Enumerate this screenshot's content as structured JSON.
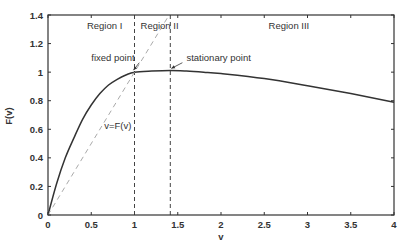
{
  "chart_data": {
    "type": "line",
    "title": "",
    "xlabel": "v",
    "ylabel": "F(v)",
    "xlim": [
      0,
      4
    ],
    "ylim": [
      0,
      1.4
    ],
    "xticks": [
      0,
      0.5,
      1,
      1.5,
      2,
      2.5,
      3,
      3.5,
      4
    ],
    "xtick_labels": [
      "0",
      "0.5",
      "1",
      "1.5",
      "2",
      "2.5",
      "3",
      "3.5",
      "4"
    ],
    "yticks": [
      0,
      0.2,
      0.4,
      0.6,
      0.8,
      1,
      1.2,
      1.4
    ],
    "ytick_labels": [
      "0",
      "0.2",
      "0.4",
      "0.6",
      "0.8",
      "1",
      "1.2",
      "1.4"
    ],
    "grid": false,
    "series": [
      {
        "name": "F(v)",
        "style": "solid",
        "x": [
          0,
          0.1,
          0.2,
          0.3,
          0.4,
          0.5,
          0.6,
          0.7,
          0.8,
          0.9,
          1.0,
          1.2,
          1.414,
          1.6,
          1.8,
          2.0,
          2.5,
          3.0,
          3.5,
          4.0
        ],
        "y": [
          0,
          0.22,
          0.4,
          0.54,
          0.67,
          0.77,
          0.85,
          0.91,
          0.95,
          0.98,
          1.0,
          1.008,
          1.012,
          1.008,
          1.0,
          0.99,
          0.955,
          0.905,
          0.85,
          0.79
        ]
      },
      {
        "name": "v=F(v)",
        "style": "dashed",
        "x": [
          0,
          1.4
        ],
        "y": [
          0,
          1.4
        ]
      }
    ],
    "vlines": [
      {
        "x": 1.0,
        "style": "dashed"
      },
      {
        "x": 1.414,
        "style": "dashed"
      }
    ],
    "annotations": [
      {
        "text": "Region I",
        "x": 0.45,
        "y": 1.3
      },
      {
        "text": "Region II",
        "x": 1.07,
        "y": 1.3
      },
      {
        "text": "Region III",
        "x": 2.55,
        "y": 1.3
      },
      {
        "text": "fixed point",
        "x": 0.5,
        "y": 1.08,
        "arrow_to": [
          1.0,
          1.0
        ]
      },
      {
        "text": "stationary point",
        "x": 1.6,
        "y": 1.08,
        "arrow_to": [
          1.414,
          1.012
        ]
      },
      {
        "text": "v=F(v)",
        "x": 0.65,
        "y": 0.6
      }
    ]
  }
}
